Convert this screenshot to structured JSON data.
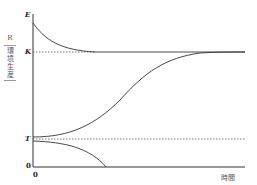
{
  "diagram": {
    "y_axis": {
      "symbol": "R",
      "label_chars": [
        "環",
        "境",
        "生",
        "産"
      ],
      "ticks": {
        "E": "E",
        "K": "K",
        "T": "T",
        "zero": "0"
      }
    },
    "x_axis": {
      "origin": "0",
      "label": "時間"
    },
    "curves": [
      {
        "name": "decay-from-E-to-K",
        "description": "Starts at E and decreases asymptotically to K"
      },
      {
        "name": "logistic-T-to-K",
        "description": "Starts just above T, S-shaped rise to K"
      },
      {
        "name": "decline-below-T",
        "description": "Starts just below T and falls to 0"
      }
    ],
    "reference_lines": [
      {
        "level": "K",
        "style": "dotted then solid"
      },
      {
        "level": "T",
        "style": "dotted"
      }
    ],
    "colors": {
      "line": "#333333",
      "dotted": "#555555"
    }
  }
}
